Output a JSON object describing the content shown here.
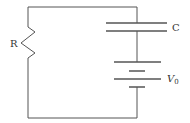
{
  "diagram": {
    "type": "circuit",
    "components": [
      {
        "id": "R",
        "kind": "resistor",
        "label": "R"
      },
      {
        "id": "C",
        "kind": "capacitor",
        "label": "C"
      },
      {
        "id": "V0",
        "kind": "battery",
        "label": "V",
        "subscript": "0"
      }
    ],
    "colors": {
      "wire": "#555555",
      "background": "#ffffff"
    }
  }
}
